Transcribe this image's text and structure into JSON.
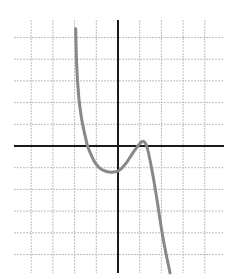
{
  "chart_data": {
    "type": "line",
    "title": "",
    "xlabel": "",
    "ylabel": "",
    "grid": true,
    "xlim": [
      -4.9,
      4.9
    ],
    "ylim": [
      -5.8,
      5.8
    ],
    "grid_step": 1,
    "series": [
      {
        "name": "f(x)",
        "color": "#888888",
        "x": [
          -1.95,
          -1.9,
          -1.8,
          -1.7,
          -1.6,
          -1.5,
          -1.4,
          -1.2,
          -1.0,
          -0.8,
          -0.6,
          -0.4,
          -0.2,
          0.0,
          0.2,
          0.4,
          0.6,
          0.8,
          1.0,
          1.1,
          1.2,
          1.3,
          1.4,
          1.6,
          1.8,
          2.0,
          2.2,
          2.4
        ],
        "y": [
          5.4,
          3.6,
          2.2,
          1.4,
          0.85,
          0.4,
          0.0,
          -0.5,
          -0.85,
          -1.05,
          -1.15,
          -1.2,
          -1.2,
          -1.15,
          -1.0,
          -0.75,
          -0.45,
          -0.15,
          0.1,
          0.2,
          0.2,
          0.05,
          -0.3,
          -1.3,
          -2.5,
          -3.8,
          -4.9,
          -5.85
        ]
      }
    ],
    "features": {
      "x_intercepts": [
        -1.4,
        1.0
      ],
      "local_minimum": [
        -0.3,
        -1.2
      ],
      "local_maximum": [
        1.2,
        0.2
      ]
    }
  },
  "colors": {
    "grid": "#bdbdbd",
    "axis": "#1a1a1a",
    "curve": "#888888"
  }
}
